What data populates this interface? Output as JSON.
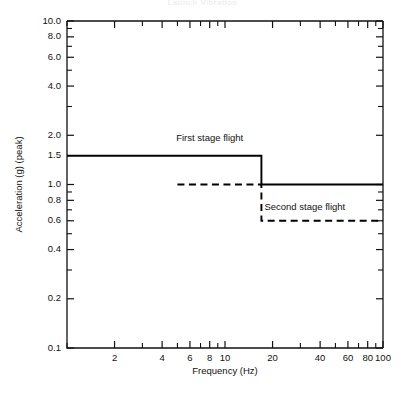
{
  "page": {
    "top_cropped_caption": "Launch Vibration"
  },
  "chart_data": {
    "type": "line",
    "title": "",
    "xlabel": "Frequency (Hz)",
    "ylabel": "Acceleration (g) (peak)",
    "xscale": "log",
    "yscale": "log",
    "xlim": [
      1,
      100
    ],
    "ylim": [
      0.1,
      10.0
    ],
    "grid": false,
    "legend_position": "inline-annotation",
    "x_tick_labels": [
      "2",
      "4",
      "6",
      "8",
      "10",
      "20",
      "40",
      "60",
      "80",
      "100"
    ],
    "x_tick_values": [
      2,
      4,
      6,
      8,
      10,
      20,
      40,
      60,
      80,
      100
    ],
    "y_tick_labels": [
      "10.0",
      "8.0",
      "6.0",
      "4.0",
      "2.0",
      "1.5",
      "1.0",
      "0.8",
      "0.6",
      "0.4",
      "0.2",
      "0.1"
    ],
    "y_tick_values": [
      10.0,
      8.0,
      6.0,
      4.0,
      2.0,
      1.5,
      1.0,
      0.8,
      0.6,
      0.4,
      0.2,
      0.1
    ],
    "series": [
      {
        "name": "First stage flight",
        "style": "solid-with-dashed-lead",
        "annotation": "First stage flight",
        "points": [
          {
            "x": 1.0,
            "y": 1.5,
            "seg": "dashed"
          },
          {
            "x": 4.5,
            "y": 1.5,
            "seg": "solid"
          },
          {
            "x": 17.0,
            "y": 1.5,
            "seg": "solid"
          },
          {
            "x": 17.0,
            "y": 1.0,
            "seg": "solid"
          },
          {
            "x": 100.0,
            "y": 1.0,
            "seg": "solid"
          }
        ]
      },
      {
        "name": "Second stage flight",
        "style": "dashed",
        "annotation": "Second stage flight",
        "points": [
          {
            "x": 5.0,
            "y": 1.0,
            "seg": "dashed"
          },
          {
            "x": 17.0,
            "y": 1.0,
            "seg": "dashed"
          },
          {
            "x": 17.0,
            "y": 0.6,
            "seg": "dashed"
          },
          {
            "x": 100.0,
            "y": 0.6,
            "seg": "dashed"
          }
        ]
      }
    ],
    "annotations": [
      {
        "text": "First stage flight",
        "x": 8.0,
        "y": 1.85
      },
      {
        "text": "Second stage flight",
        "x": 32.0,
        "y": 0.7
      }
    ]
  }
}
